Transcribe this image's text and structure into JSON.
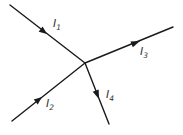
{
  "diagram": {
    "type": "current junction (Kirchhoff's current law)",
    "junction": {
      "x": 85,
      "y": 63
    },
    "currents": [
      {
        "id": "I1",
        "symbol": "I",
        "subscript": "1",
        "direction": "into junction",
        "from": [
          10,
          5
        ],
        "to": [
          85,
          63
        ],
        "label_pos": [
          54,
          27
        ]
      },
      {
        "id": "I2",
        "symbol": "I",
        "subscript": "2",
        "direction": "into junction",
        "from": [
          12,
          121
        ],
        "to": [
          85,
          63
        ],
        "label_pos": [
          47,
          107
        ]
      },
      {
        "id": "I3",
        "symbol": "I",
        "subscript": "3",
        "direction": "out of junction",
        "from": [
          85,
          63
        ],
        "to": [
          173,
          27
        ],
        "label_pos": [
          141,
          55
        ]
      },
      {
        "id": "I4",
        "symbol": "I",
        "subscript": "4",
        "direction": "out of junction",
        "from": [
          85,
          63
        ],
        "to": [
          109,
          124
        ],
        "label_pos": [
          106,
          98
        ]
      }
    ],
    "labels": {
      "i1": {
        "symbol": "I",
        "sub": "1"
      },
      "i2": {
        "symbol": "I",
        "sub": "2"
      },
      "i3": {
        "symbol": "I",
        "sub": "3"
      },
      "i4": {
        "symbol": "I",
        "sub": "4"
      }
    },
    "colors": {
      "line": "#1a1a1a",
      "text": "#333333",
      "background": "#ffffff"
    }
  }
}
